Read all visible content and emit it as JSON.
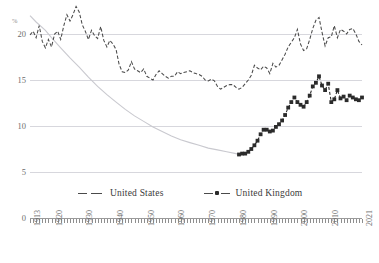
{
  "chart_data": {
    "type": "line",
    "title": "",
    "xlabel": "",
    "ylabel": "%",
    "ylim": [
      5,
      22
    ],
    "ytick_labels": [
      "20",
      "15",
      "10",
      "5",
      "0"
    ],
    "ytick_values": [
      20,
      15,
      10,
      5,
      0
    ],
    "xtick_labels": [
      "1913",
      "1920",
      "1930",
      "1940",
      "1950",
      "1960",
      "1970",
      "1980",
      "1990",
      "2000",
      "2010",
      "2021"
    ],
    "xtick_values": [
      1913,
      1920,
      1930,
      1940,
      1950,
      1960,
      1970,
      1980,
      1990,
      2000,
      2010,
      2021
    ],
    "xlim": [
      1913,
      2021
    ],
    "grid": true,
    "broken_axis": true,
    "legend_position": "bottom-center",
    "series": [
      {
        "name": "United States",
        "style": "dashed",
        "color": "#4a4a4a",
        "marker": "none",
        "x": [
          1913,
          1914,
          1915,
          1916,
          1917,
          1918,
          1919,
          1920,
          1921,
          1922,
          1923,
          1924,
          1925,
          1926,
          1927,
          1928,
          1929,
          1930,
          1931,
          1932,
          1933,
          1934,
          1935,
          1936,
          1937,
          1938,
          1939,
          1940,
          1941,
          1942,
          1943,
          1944,
          1945,
          1946,
          1947,
          1948,
          1949,
          1950,
          1951,
          1952,
          1953,
          1954,
          1955,
          1956,
          1957,
          1958,
          1959,
          1960,
          1961,
          1962,
          1963,
          1964,
          1965,
          1966,
          1967,
          1968,
          1969,
          1970,
          1971,
          1972,
          1973,
          1974,
          1975,
          1976,
          1977,
          1978,
          1979,
          1980,
          1981,
          1982,
          1983,
          1984,
          1985,
          1986,
          1987,
          1988,
          1989,
          1990,
          1991,
          1992,
          1993,
          1994,
          1995,
          1996,
          1997,
          1998,
          1999,
          2000,
          2001,
          2002,
          2003,
          2004,
          2005,
          2006,
          2007,
          2008,
          2009,
          2010,
          2011,
          2012,
          2013,
          2014,
          2015,
          2016,
          2017,
          2018,
          2019,
          2020,
          2021
        ],
        "values": [
          19.9,
          20.3,
          19.6,
          20.9,
          19.2,
          18.5,
          19.4,
          18.6,
          20.0,
          20.3,
          19.4,
          20.9,
          22.1,
          21.4,
          22.1,
          23.0,
          22.4,
          21.0,
          20.3,
          19.4,
          20.4,
          19.8,
          19.5,
          20.8,
          19.3,
          18.6,
          19.3,
          18.9,
          18.3,
          16.7,
          15.9,
          15.8,
          16.1,
          17.0,
          16.2,
          16.0,
          15.8,
          16.2,
          15.4,
          15.2,
          15.0,
          15.6,
          16.0,
          15.7,
          15.4,
          15.2,
          15.4,
          15.4,
          15.9,
          15.7,
          15.8,
          15.9,
          16.0,
          15.8,
          15.7,
          15.6,
          15.4,
          15.0,
          14.9,
          15.1,
          14.9,
          14.3,
          14.0,
          14.2,
          14.4,
          14.5,
          14.5,
          14.2,
          14.0,
          14.2,
          14.6,
          15.0,
          15.5,
          16.6,
          16.3,
          16.1,
          16.5,
          16.3,
          15.7,
          16.8,
          16.4,
          16.6,
          17.2,
          17.8,
          18.6,
          19.1,
          19.6,
          20.5,
          18.9,
          18.2,
          18.4,
          19.4,
          20.6,
          21.5,
          21.8,
          20.2,
          18.7,
          19.6,
          19.7,
          20.9,
          19.6,
          20.5,
          20.3,
          20.0,
          20.5,
          20.6,
          20.0,
          19.2,
          18.8
        ]
      },
      {
        "name": "United Kingdom",
        "style": "dashed",
        "color": "#2b2b2b",
        "marker": "square",
        "marker_from_year": 1981,
        "x": [
          1913,
          1915,
          1918,
          1920,
          1923,
          1926,
          1929,
          1932,
          1935,
          1938,
          1941,
          1944,
          1947,
          1950,
          1953,
          1956,
          1959,
          1962,
          1965,
          1968,
          1971,
          1974,
          1977,
          1980,
          1981,
          1982,
          1983,
          1984,
          1985,
          1986,
          1987,
          1988,
          1989,
          1990,
          1991,
          1992,
          1993,
          1994,
          1995,
          1996,
          1997,
          1998,
          1999,
          2000,
          2001,
          2002,
          2003,
          2004,
          2005,
          2006,
          2007,
          2008,
          2009,
          2010,
          2011,
          2012,
          2013,
          2014,
          2015,
          2016,
          2017,
          2018,
          2019,
          2020,
          2021
        ],
        "values": [
          22.0,
          21.3,
          20.4,
          19.6,
          18.5,
          17.4,
          16.4,
          15.3,
          14.3,
          13.4,
          12.6,
          11.8,
          11.1,
          10.5,
          9.9,
          9.4,
          8.9,
          8.5,
          8.2,
          7.9,
          7.6,
          7.4,
          7.2,
          7.0,
          6.9,
          7.0,
          7.0,
          7.2,
          7.5,
          7.9,
          8.4,
          9.1,
          9.6,
          9.6,
          9.4,
          9.5,
          9.9,
          10.2,
          10.6,
          11.2,
          12.0,
          12.6,
          13.1,
          12.6,
          12.3,
          12.1,
          12.6,
          13.3,
          14.3,
          14.7,
          15.4,
          14.4,
          13.9,
          14.6,
          12.6,
          12.9,
          13.9,
          13.0,
          13.2,
          12.8,
          13.3,
          13.1,
          12.9,
          12.8,
          13.1
        ]
      }
    ]
  },
  "axis": {
    "unit_label": "%"
  },
  "legend": {
    "items": [
      {
        "label": "United States"
      },
      {
        "label": "United Kingdom"
      }
    ]
  },
  "source": {
    "text": ""
  }
}
